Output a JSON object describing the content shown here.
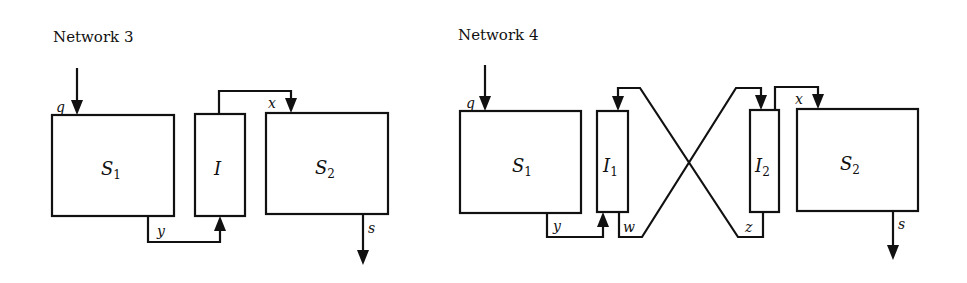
{
  "diagrams": [
    {
      "title": "Network 3",
      "blocks": [
        {
          "id": "S1",
          "label": "S",
          "subscript": "1"
        },
        {
          "id": "I",
          "label": "I",
          "subscript": ""
        },
        {
          "id": "S2",
          "label": "S",
          "subscript": "2"
        }
      ],
      "signals": {
        "q": "q",
        "y": "y",
        "x": "x",
        "s": "s"
      }
    },
    {
      "title": "Network 4",
      "blocks": [
        {
          "id": "S1",
          "label": "S",
          "subscript": "1"
        },
        {
          "id": "I1",
          "label": "I",
          "subscript": "1"
        },
        {
          "id": "I2",
          "label": "I",
          "subscript": "2"
        },
        {
          "id": "S2",
          "label": "S",
          "subscript": "2"
        }
      ],
      "signals": {
        "q": "q",
        "y": "y",
        "w": "w",
        "z": "z",
        "x": "x",
        "s": "s"
      }
    }
  ],
  "colors": {
    "stroke": "#111111",
    "background": "#ffffff"
  }
}
